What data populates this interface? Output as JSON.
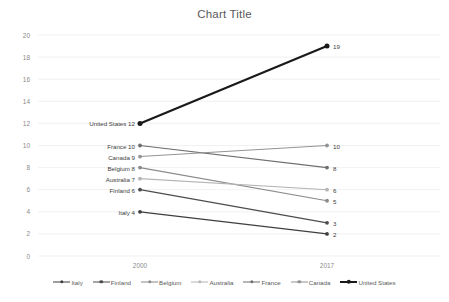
{
  "chart_data": {
    "type": "line",
    "title": "Chart Title",
    "xlabel": "",
    "ylabel": "",
    "categories": [
      "2000",
      "2017"
    ],
    "x": [
      2000,
      2017
    ],
    "ylim": [
      0,
      20
    ],
    "yticks": [
      0,
      2,
      4,
      6,
      8,
      10,
      12,
      14,
      16,
      18,
      20
    ],
    "grid": true,
    "legend_position": "bottom",
    "series": [
      {
        "name": "Italy",
        "values": [
          4,
          2
        ],
        "color": "#3f3f3f",
        "left_label": "Italy 4",
        "right_label": "2",
        "width": 1.3
      },
      {
        "name": "Finland",
        "values": [
          6,
          3
        ],
        "color": "#4d4d4d",
        "left_label": "Finland 6",
        "right_label": "3",
        "width": 1.3
      },
      {
        "name": "Belgium",
        "values": [
          8,
          5
        ],
        "color": "#8a8a8a",
        "left_label": "Belgium 8",
        "right_label": "5",
        "width": 1.1
      },
      {
        "name": "Australia",
        "values": [
          7,
          6
        ],
        "color": "#b5b5b5",
        "left_label": "Australia 7",
        "right_label": "6",
        "width": 1.1
      },
      {
        "name": "France",
        "values": [
          10,
          8
        ],
        "color": "#6e6e6e",
        "left_label": "France 10",
        "right_label": "8",
        "width": 1.1
      },
      {
        "name": "Canada",
        "values": [
          9,
          10
        ],
        "color": "#939393",
        "left_label": "Canada 9",
        "right_label": "10",
        "width": 1.1
      },
      {
        "name": "United States",
        "values": [
          12,
          19
        ],
        "color": "#1a1a1a",
        "left_label": "United States 12",
        "right_label": "19",
        "width": 2.2
      }
    ]
  },
  "legend": {
    "items": [
      {
        "label": "Italy"
      },
      {
        "label": "Finland"
      },
      {
        "label": "Belgium"
      },
      {
        "label": "Australia"
      },
      {
        "label": "France"
      },
      {
        "label": "Canada"
      },
      {
        "label": "United States"
      }
    ]
  }
}
